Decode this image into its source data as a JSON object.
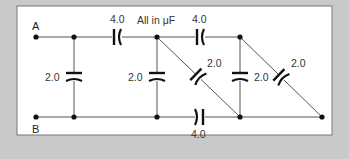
{
  "diagram": {
    "title_note": "All in μF",
    "terminals": {
      "a": "A",
      "b": "B"
    },
    "capacitors": [
      {
        "id": "c_top_1",
        "value": "4.0",
        "orientation": "series-top"
      },
      {
        "id": "c_top_2",
        "value": "4.0",
        "orientation": "series-top"
      },
      {
        "id": "c_bottom",
        "value": "4.0",
        "orientation": "series-bottom"
      },
      {
        "id": "c_shunt_1",
        "value": "2.0",
        "orientation": "vertical"
      },
      {
        "id": "c_shunt_2",
        "value": "2.0",
        "orientation": "vertical"
      },
      {
        "id": "c_diag_1",
        "value": "2.0",
        "orientation": "diagonal"
      },
      {
        "id": "c_shunt_3",
        "value": "2.0",
        "orientation": "vertical"
      },
      {
        "id": "c_diag_2",
        "value": "2.0",
        "orientation": "diagonal"
      }
    ],
    "colors": {
      "background": "#c9c9c9",
      "panel": "#ffffff",
      "wire": "#555555",
      "plate": "#111111"
    }
  }
}
